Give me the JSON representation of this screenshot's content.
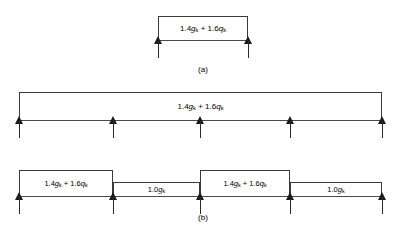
{
  "diagram": {
    "type": "structural-load-arrangement",
    "ultimate_load_label": "1.4gₖ + 1.6qₖ",
    "dead_load_label": "1.0gₖ",
    "figures": [
      {
        "id": "a",
        "caption": "(a)",
        "description": "single span beam with ultimate design load",
        "spans": 1,
        "supports": 2,
        "span_loads": [
          "1.4gₖ + 1.6qₖ"
        ]
      },
      {
        "id": "b-all-spans-loaded",
        "caption": "",
        "description": "four span continuous beam, all spans carrying ultimate design load",
        "spans": 4,
        "supports": 5,
        "span_loads": [
          "1.4gₖ + 1.6qₖ",
          "1.4gₖ + 1.6qₖ",
          "1.4gₖ + 1.6qₖ",
          "1.4gₖ + 1.6qₖ"
        ]
      },
      {
        "id": "b-alternate-spans-loaded",
        "caption": "(b)",
        "description": "four span continuous beam, alternate spans loaded",
        "spans": 4,
        "supports": 5,
        "span_loads": [
          "1.4gₖ + 1.6qₖ",
          "1.0gₖ",
          "1.4gₖ + 1.6qₖ",
          "1.0gₖ"
        ]
      }
    ],
    "labels": {
      "caption_a": "(a)",
      "caption_b": "(b)",
      "load_ultimate_prefix": "1.4",
      "load_ultimate_g": "g",
      "load_ultimate_mid": " + 1.6",
      "load_ultimate_q": "q",
      "load_dead_prefix": "1.0",
      "load_dead_g": "g",
      "subscript_k": "k"
    },
    "colors": {
      "background": "#ffffff",
      "line": "#3a3a3a",
      "arrow": "#1a1a1a",
      "text": "#000000"
    }
  }
}
